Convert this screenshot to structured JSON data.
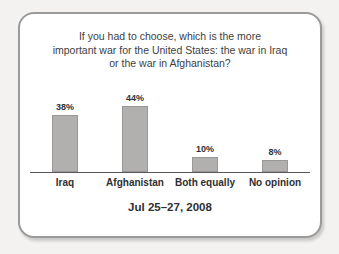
{
  "card": {
    "title_lines": [
      "If you had to choose, which is the more",
      "important war for the United States: the war in Iraq",
      "or the war in Afghanistan?"
    ],
    "date_label": "Jul 25–27, 2008"
  },
  "chart_data": {
    "type": "bar",
    "title": "If you had to choose, which is the more important war for the United States: the war in Iraq or the war in Afghanistan?",
    "categories": [
      "Iraq",
      "Afghanistan",
      "Both equally",
      "No opinion"
    ],
    "values": [
      38,
      44,
      10,
      8
    ],
    "value_labels": [
      "38%",
      "44%",
      "10%",
      "8%"
    ],
    "unit": "%",
    "xlabel": "",
    "ylabel": "",
    "ylim": [
      0,
      50
    ],
    "grid": false,
    "legend": false,
    "footer": "Jul 25–27, 2008",
    "bar_color": "#b1b0af",
    "bar_border_color": "#999897",
    "axis_color": "#57575b",
    "title_color": "#3e3e40",
    "label_color": "#2f2f31",
    "card_background": "#ffffff",
    "card_border_color": "#9a9a9a",
    "page_background": "#f3f2f0"
  }
}
